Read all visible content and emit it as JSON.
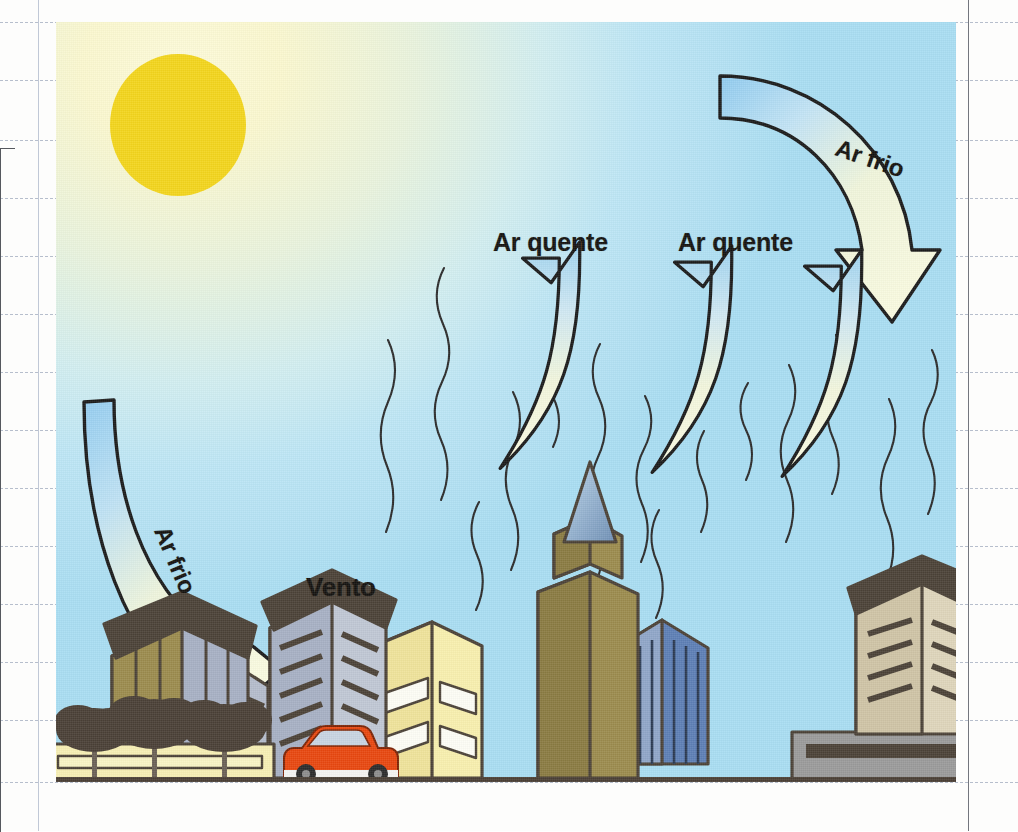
{
  "page": {
    "kind": "scanned-textbook-page",
    "background_color": "#fdfdfc",
    "rule_line_color": "#aab4c4",
    "margin_line_color": "#b9c2d2"
  },
  "illustration": {
    "name": "urban-heat-island-diagram",
    "frame": {
      "x": 56,
      "y": 22,
      "width": 900,
      "height": 760
    },
    "sky": {
      "top_left_color": "#fbf8cf",
      "mid_color": "#d2eef0",
      "bottom_right_color": "#a2d9f2"
    },
    "sun": {
      "color": "#f3d51c",
      "cx": 178,
      "cy": 125,
      "rx": 68,
      "ry": 70
    },
    "ground": {
      "color": "#4a3f35",
      "label": "ground-line"
    }
  },
  "labels": {
    "hot_air_1": "Ar quente",
    "hot_air_2": "Ar quente",
    "cold_air_left": "Ar frio",
    "cold_air_right": "Ar frio",
    "wind": "Vento"
  },
  "arrows": {
    "hot_air_up": [
      {
        "id": "hot-arrow-1",
        "direction": "up",
        "x": 515,
        "tip_y": 255
      },
      {
        "id": "hot-arrow-2",
        "direction": "up",
        "x": 668,
        "tip_y": 258
      },
      {
        "id": "hot-arrow-3",
        "direction": "up",
        "x": 798,
        "tip_y": 262
      }
    ],
    "cold_air_curved": [
      {
        "id": "cold-arrow-left",
        "from": "upper-left",
        "to": "lower-right",
        "label": "Ar frio"
      },
      {
        "id": "cold-arrow-right",
        "from": "upper-left",
        "to": "lower-right",
        "label": "Ar frio"
      }
    ],
    "fill_top_color": "#a8d8f2",
    "fill_bottom_color": "#f6f7d6",
    "stroke_color": "#1b1b1b"
  },
  "heat_squiggles": {
    "count": 14,
    "stroke_color": "#2b2b2b",
    "description": "wavy vertical lines rising from the city"
  },
  "city": {
    "buildings": [
      {
        "name": "building-left-tower",
        "front_color": "#a7b0c4",
        "side_color": "#9b8b4d",
        "roof_color": "#4b4237"
      },
      {
        "name": "building-low-podium-left",
        "front_color": "#f7efb4",
        "roof_color": "#4b4237"
      },
      {
        "name": "building-slim-gray",
        "front_color": "#b4bccb",
        "roof_color": "#4b4237"
      },
      {
        "name": "building-striped-gray",
        "front_color": "#c0c7d4",
        "side_color": "#a7b0c4",
        "roof_color": "#4b4237"
      },
      {
        "name": "building-yellow",
        "front_color": "#f8efae",
        "side_color": "#efe39a",
        "roof_color": "#4b4237"
      },
      {
        "name": "building-spire-tower",
        "front_color": "#9b8b4d",
        "side_color": "#8a7b42",
        "spire_color": "#9fbfdd",
        "roof_color": "#4b4237"
      },
      {
        "name": "building-blue-glass",
        "front_color": "#5d7fb5",
        "side_color": "#8fa6c8",
        "roof_color": "#4b4237"
      },
      {
        "name": "building-beige-right",
        "front_color": "#ded5bb",
        "side_color": "#cfc4a6",
        "roof_color": "#4b4237"
      },
      {
        "name": "building-gray-podium-right",
        "front_color": "#9a9a9a",
        "roof_color": "#4b4237"
      }
    ],
    "trees": {
      "count": 3,
      "foliage_color": "#4a4036",
      "trunk_color": "#6b6155"
    },
    "car": {
      "name": "red-car",
      "body_color": "#e8470f",
      "window_color": "#c8d4e2",
      "wheel_color": "#2b2b2b"
    }
  }
}
